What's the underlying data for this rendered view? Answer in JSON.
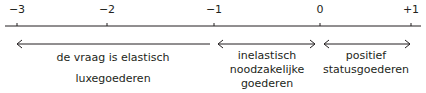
{
  "axis": {
    "ticks": [
      {
        "value": -3,
        "label": "−3",
        "x": 17
      },
      {
        "value": -2,
        "label": "−2",
        "x": 107
      },
      {
        "value": -1,
        "label": "−1",
        "x": 214
      },
      {
        "value": 0,
        "label": "0",
        "x": 320
      },
      {
        "value": 1,
        "label": "+1",
        "x": 411
      }
    ],
    "color": "#231f20"
  },
  "regions": [
    {
      "name": "elastisch",
      "arrow": "left",
      "line1": "de vraag is elastisch",
      "line2": "luxegoederen",
      "line3": ""
    },
    {
      "name": "inelastisch",
      "arrow": "both",
      "line1": "inelastisch",
      "line2": "noodzakelijke",
      "line3": "goederen"
    },
    {
      "name": "positief",
      "arrow": "both",
      "line1": "positief",
      "line2": "statusgoederen",
      "line3": ""
    }
  ]
}
